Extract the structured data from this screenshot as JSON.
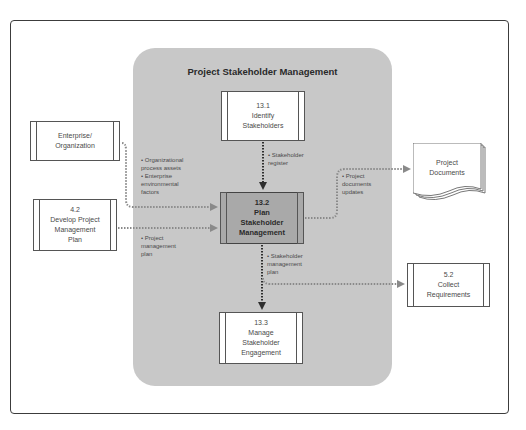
{
  "diagram": {
    "title": "Project Stakeholder Management",
    "processes": [
      {
        "id": "13.1",
        "number": "13.1",
        "name": "Identify\nStakeholders",
        "text": "13.1\nIdentify\nStakeholders"
      },
      {
        "id": "13.2",
        "number": "13.2",
        "name": "Plan\nStakeholder\nManagement",
        "text": "13.2\nPlan\nStakeholder\nManagement",
        "highlighted": true
      },
      {
        "id": "13.3",
        "number": "13.3",
        "name": "Manage\nStakeholder\nEngagement",
        "text": "13.3\nManage\nStakeholder\nEngagement"
      }
    ],
    "external": [
      {
        "id": "enterprise",
        "text": "Enterprise/\nOrganization"
      },
      {
        "id": "4.2",
        "text": "4.2\nDevelop Project\nManagement\nPlan"
      },
      {
        "id": "project-documents",
        "text": "Project\nDocuments"
      },
      {
        "id": "5.2",
        "text": "5.2\nCollect\nRequirements"
      }
    ],
    "flows": [
      {
        "from": "enterprise",
        "to": "13.2",
        "label": "• Organizational\n  process assets\n• Enterprise\n  environmental\n  factors"
      },
      {
        "from": "4.2",
        "to": "13.2",
        "label": "• Project\n  management\n  plan"
      },
      {
        "from": "13.1",
        "to": "13.2",
        "label": "• Stakeholder\n  register"
      },
      {
        "from": "13.2",
        "to": "project-documents",
        "label": "• Project\n  documents\n  updates"
      },
      {
        "from": "13.2",
        "to": "13.3",
        "label": "• Stakeholder\n  management\n  plan"
      },
      {
        "from": "13.2",
        "to": "5.2",
        "label": ""
      }
    ],
    "colors": {
      "panel": "#c8c8c8",
      "center_process": "#a9a9a9",
      "internal_arrow": "#2e2e2e",
      "external_arrow": "#8a8a8a"
    }
  }
}
